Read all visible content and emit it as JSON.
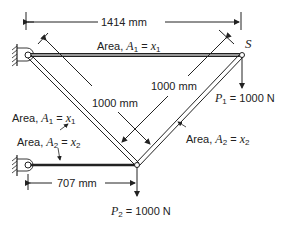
{
  "diagram": {
    "type": "truss",
    "dimensions": {
      "top_span": "1414 mm",
      "diag_left": "1000 mm",
      "diag_right": "1000 mm",
      "bottom_span": "707 mm"
    },
    "node_label": "S",
    "labels": {
      "area_top": {
        "prefix": "Area, ",
        "var": "A",
        "sub": "1",
        "eq": " = ",
        "xvar": "x",
        "xsub": "1"
      },
      "area_left_diag": {
        "prefix": "Area, ",
        "var": "A",
        "sub": "1",
        "eq": " = ",
        "xvar": "x",
        "xsub": "1"
      },
      "area_bottom": {
        "prefix": "Area, ",
        "var": "A",
        "sub": "2",
        "eq": " = ",
        "xvar": "x",
        "xsub": "2"
      },
      "area_right_diag": {
        "prefix": "Area, ",
        "var": "A",
        "sub": "2",
        "eq": " = ",
        "xvar": "x",
        "xsub": "2"
      }
    },
    "loads": {
      "p1": {
        "var": "P",
        "sub": "1",
        "value": " = 1000 N"
      },
      "p2": {
        "var": "P",
        "sub": "2",
        "value": " = 1000 N"
      }
    },
    "colors": {
      "line": "#222222",
      "background": "#ffffff"
    }
  }
}
